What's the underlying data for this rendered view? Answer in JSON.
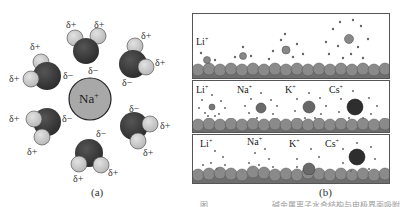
{
  "figure": {
    "panel_a": {
      "label": "(a)",
      "center_ion": {
        "symbol": "Na",
        "charge": "+"
      },
      "partial_positive": "δ+",
      "partial_negative": "δ−",
      "molecule_count": 6
    },
    "panel_b": {
      "label": "(b)",
      "rows": [
        {
          "ions": [
            {
              "symbol": "Li",
              "charge": "+"
            }
          ]
        },
        {
          "ions": [
            {
              "symbol": "Li",
              "charge": "+"
            },
            {
              "symbol": "Na",
              "charge": "+"
            },
            {
              "symbol": "K",
              "charge": "+"
            },
            {
              "symbol": "Cs",
              "charge": "+"
            }
          ]
        },
        {
          "ions": [
            {
              "symbol": "Li",
              "charge": "+"
            },
            {
              "symbol": "Na",
              "charge": "+"
            },
            {
              "symbol": "K",
              "charge": "+"
            },
            {
              "symbol": "Cs",
              "charge": "+"
            }
          ]
        }
      ]
    },
    "caption_fragment": "图……………………碱金属离子水合结构与电极界面吸附示意"
  },
  "colors": {
    "oxygen": "#3a3a3a",
    "hydrogen": "#c8c8c8",
    "sodium": "#a8a8a8",
    "surface": "#7a7a7a"
  }
}
